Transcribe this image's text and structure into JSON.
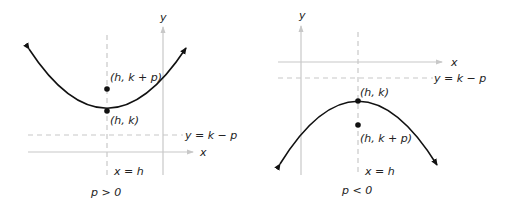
{
  "panels": [
    {
      "id": "upward",
      "axis_x_label": "x",
      "axis_y_label": "y",
      "vertex_label": "(h, k)",
      "focus_label": "(h, k + p)",
      "directrix_label": "y = k − p",
      "axis_of_symmetry_label": "x = h",
      "condition_label": "p > 0"
    },
    {
      "id": "downward",
      "axis_x_label": "x",
      "axis_y_label": "y",
      "vertex_label": "(h, k)",
      "focus_label": "(h, k + p)",
      "directrix_label": "y = k − p",
      "axis_of_symmetry_label": "x = h",
      "condition_label": "p < 0"
    }
  ],
  "colors": {
    "axis": "#c8c8c8",
    "curve": "#111111",
    "text": "#222222"
  }
}
